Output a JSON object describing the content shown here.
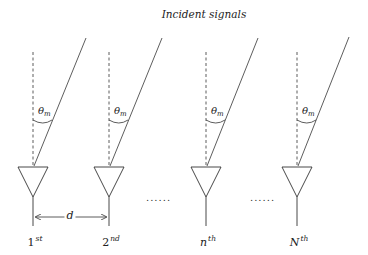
{
  "title": "Incident signals",
  "angle_label": {
    "symbol": "θ",
    "subscript": "m"
  },
  "spacing_label": "d",
  "ellipsis": "......",
  "antennas": [
    {
      "index": 0,
      "base": "1",
      "suffix": "st",
      "italic": false,
      "x": 33
    },
    {
      "index": 1,
      "base": "2",
      "suffix": "nd",
      "italic": false,
      "x": 109
    },
    {
      "index": 2,
      "base": "n",
      "suffix": "th",
      "italic": true,
      "x": 206
    },
    {
      "index": 3,
      "base": "N",
      "suffix": "th",
      "italic": true,
      "x": 297
    }
  ],
  "colors": {
    "line": "#333333",
    "background": "#ffffff"
  }
}
